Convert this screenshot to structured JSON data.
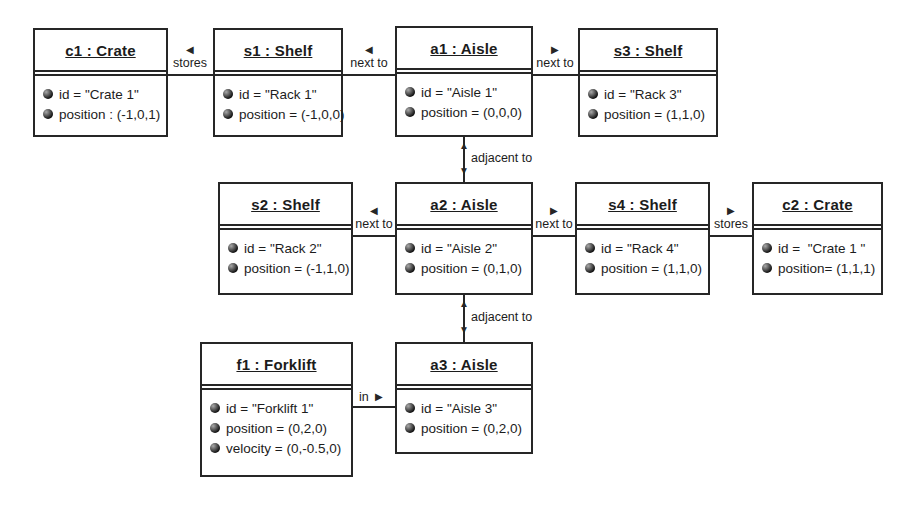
{
  "diagram": {
    "colors": {
      "line": "#262626",
      "background": "#ffffff",
      "text": "#1c1c1c"
    },
    "icons": {
      "arrow_left": "◀",
      "arrow_right": "▶",
      "arrow_up": "▲",
      "arrow_down": "▼",
      "attribute_ball": "●"
    },
    "objects": [
      {
        "name": "c1",
        "title": "c1 : Crate",
        "attributes": [
          "id = \"Crate 1\"",
          "position : (-1,0,1)"
        ]
      },
      {
        "name": "s1",
        "title": "s1 : Shelf",
        "attributes": [
          "id = \"Rack 1\"",
          "position = (-1,0,0)"
        ]
      },
      {
        "name": "a1",
        "title": "a1 : Aisle",
        "attributes": [
          "id = \"Aisle 1\"",
          "position = (0,0,0)"
        ]
      },
      {
        "name": "s3",
        "title": "s3 : Shelf",
        "attributes": [
          "id = \"Rack 3\"",
          "position = (1,1,0)"
        ]
      },
      {
        "name": "s2",
        "title": "s2 : Shelf",
        "attributes": [
          "id = \"Rack 2\"",
          "position = (-1,1,0)"
        ]
      },
      {
        "name": "a2",
        "title": "a2 : Aisle",
        "attributes": [
          "id = \"Aisle 2\"",
          "position = (0,1,0)"
        ]
      },
      {
        "name": "s4",
        "title": "s4 : Shelf",
        "attributes": [
          "id = \"Rack 4\"",
          "position = (1,1,0)"
        ]
      },
      {
        "name": "c2",
        "title": "c2 : Crate",
        "attributes": [
          "id =  \"Crate 1 \"",
          "position= (1,1,1)"
        ]
      },
      {
        "name": "f1",
        "title": "f1 : Forklift",
        "attributes": [
          "id = \"Forklift 1\"",
          "position = (0,2,0)",
          "velocity = (0,-0.5,0)"
        ]
      },
      {
        "name": "a3",
        "title": "a3 : Aisle",
        "attributes": [
          "id = \"Aisle 3\"",
          "position = (0,2,0)"
        ]
      }
    ],
    "links": [
      {
        "from": "s1",
        "to": "c1",
        "label": "stores",
        "direction": "left"
      },
      {
        "from": "a1",
        "to": "s1",
        "label": "next to",
        "direction": "left"
      },
      {
        "from": "a1",
        "to": "s3",
        "label": "next to",
        "direction": "right"
      },
      {
        "from": "a2",
        "to": "s2",
        "label": "next to",
        "direction": "left"
      },
      {
        "from": "a2",
        "to": "s4",
        "label": "next to",
        "direction": "right"
      },
      {
        "from": "s4",
        "to": "c2",
        "label": "stores",
        "direction": "right"
      },
      {
        "from": "f1",
        "to": "a3",
        "label": "in",
        "direction": "right"
      },
      {
        "from": "a1",
        "to": "a2",
        "label": "adjacent to",
        "direction": "both"
      },
      {
        "from": "a2",
        "to": "a3",
        "label": "adjacent to",
        "direction": "both"
      }
    ]
  }
}
